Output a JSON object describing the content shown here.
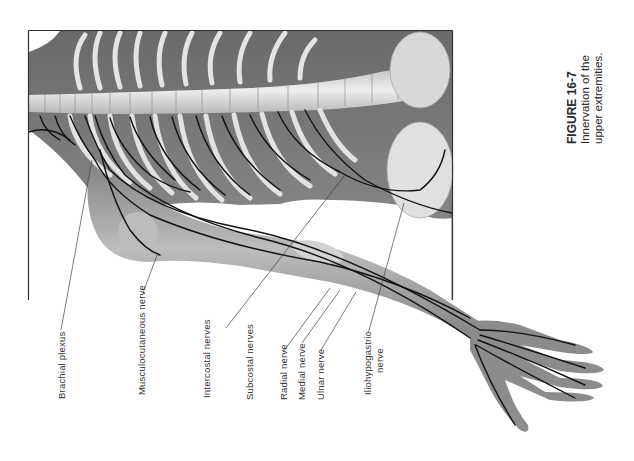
{
  "figure": {
    "number": "FIGURE 16-7",
    "caption_line1": "Innervation of the",
    "caption_line2": "upper extremities."
  },
  "labels": [
    {
      "id": "brachial-plexus",
      "text": "Brachial plexus"
    },
    {
      "id": "musculocutaneous-nerve",
      "text": "Musculocutaneous nerve"
    },
    {
      "id": "intercostal-nerves",
      "text": "Intercostal nerves"
    },
    {
      "id": "subcostal-nerves",
      "text": "Subcostal nerves"
    },
    {
      "id": "radial-nerve",
      "text": "Radial nerve"
    },
    {
      "id": "medial-nerve",
      "text": "Medial  nerve"
    },
    {
      "id": "ulnar-nerve",
      "text": "Ulnar nerve"
    },
    {
      "id": "iliohypogastric-nerve-1",
      "text": "Iliohypogastric"
    },
    {
      "id": "iliohypogastric-nerve-2",
      "text": "nerve"
    }
  ],
  "colors": {
    "background": "#ffffff",
    "frame": "#333333",
    "body_shade": "#6e6e6e",
    "bone": "#dcdcdc",
    "nerve": "#111111"
  }
}
